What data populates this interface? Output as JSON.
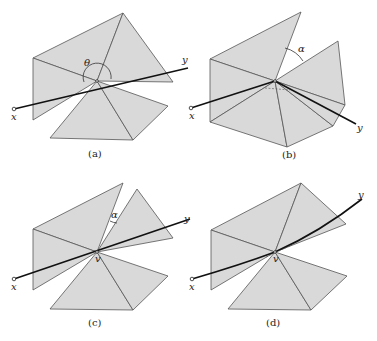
{
  "figure": {
    "panels": [
      {
        "id": "a",
        "caption": "(a)",
        "angle_label": "θ",
        "axis_start_label": "x",
        "axis_end_label": "y"
      },
      {
        "id": "b",
        "caption": "(b)",
        "angle_label": "α",
        "axis_start_label": "x",
        "axis_end_label": "y"
      },
      {
        "id": "c",
        "caption": "(c)",
        "angle_label": "α",
        "axis_start_label": "x",
        "axis_end_label": "y",
        "vertex_label": "v"
      },
      {
        "id": "d",
        "caption": "(d)",
        "axis_start_label": "x",
        "axis_end_label": "y",
        "vertex_label": "v"
      }
    ],
    "colors": {
      "face_fill": "#d9d9d9",
      "edge": "#555555",
      "axis": "#111111"
    }
  }
}
